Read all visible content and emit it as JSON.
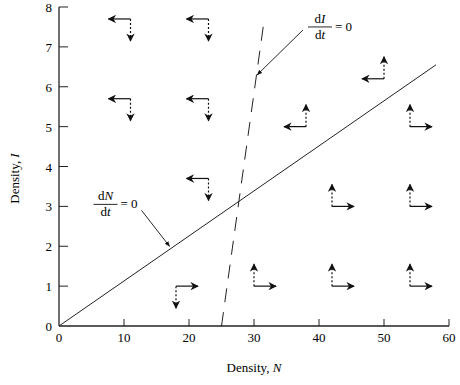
{
  "chart_data": {
    "type": "line",
    "title": "",
    "xlabel": "Density, N",
    "ylabel": "Density, I",
    "xlim": [
      0,
      60
    ],
    "ylim": [
      0,
      8
    ],
    "x_ticks": [
      0,
      10,
      20,
      30,
      40,
      50,
      60
    ],
    "y_ticks": [
      0,
      1,
      2,
      3,
      4,
      5,
      6,
      7,
      8
    ],
    "grid": false,
    "series": [
      {
        "name": "dN/dt = 0",
        "style": "solid",
        "points": [
          [
            0,
            0
          ],
          [
            58,
            6.55
          ]
        ]
      },
      {
        "name": "dI/dt = 0",
        "style": "dashed",
        "points": [
          [
            25,
            0
          ],
          [
            31.5,
            7.6
          ]
        ]
      }
    ],
    "annotations": [
      {
        "text_num": "dN",
        "text_den": "dt",
        "eq": "= 0",
        "label_at": [
          5,
          3.05
        ],
        "arrow_to": [
          17,
          2.0
        ]
      },
      {
        "text_num": "dI",
        "text_den": "dt",
        "eq": "= 0",
        "label_at": [
          38,
          7.5
        ],
        "arrow_to": [
          30.5,
          6.3
        ]
      }
    ],
    "vector_field": [
      {
        "x": 11,
        "y": 7.7,
        "dN": "left",
        "dI": "down"
      },
      {
        "x": 23,
        "y": 7.7,
        "dN": "left",
        "dI": "down"
      },
      {
        "x": 11,
        "y": 5.7,
        "dN": "left",
        "dI": "down"
      },
      {
        "x": 23,
        "y": 5.7,
        "dN": "left",
        "dI": "down"
      },
      {
        "x": 23,
        "y": 3.7,
        "dN": "left",
        "dI": "down"
      },
      {
        "x": 18,
        "y": 1.0,
        "dN": "right",
        "dI": "down"
      },
      {
        "x": 38,
        "y": 5.0,
        "dN": "left",
        "dI": "up"
      },
      {
        "x": 50,
        "y": 6.2,
        "dN": "left",
        "dI": "up"
      },
      {
        "x": 54,
        "y": 5.0,
        "dN": "right",
        "dI": "up"
      },
      {
        "x": 42,
        "y": 3.0,
        "dN": "right",
        "dI": "up"
      },
      {
        "x": 54,
        "y": 3.0,
        "dN": "right",
        "dI": "up"
      },
      {
        "x": 30,
        "y": 1.0,
        "dN": "right",
        "dI": "up"
      },
      {
        "x": 42,
        "y": 1.0,
        "dN": "right",
        "dI": "up"
      },
      {
        "x": 54,
        "y": 1.0,
        "dN": "right",
        "dI": "up"
      }
    ]
  }
}
